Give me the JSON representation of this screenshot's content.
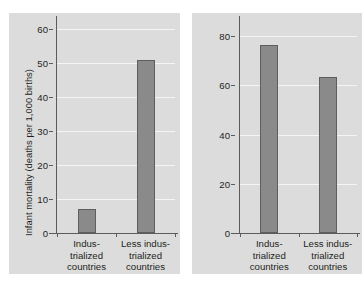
{
  "figure": {
    "background_color": "#ffffff",
    "panel_color": "#dcdcdc",
    "bar_color": "#8a8a8a",
    "bar_outline_color": "#5e5e5e",
    "gridline_color": "#f4f4f4",
    "axis_color": "#5b5b5b"
  },
  "chart_data": [
    {
      "type": "bar",
      "title": "",
      "xlabel": "",
      "ylabel": "Infant mortality (deaths per 1,000 births)",
      "categories": [
        "Indus-\ntrialized\ncountries",
        "Less indus-\ntrialized\ncountries"
      ],
      "category_lines": [
        [
          "Indus-",
          "trialized",
          "countries"
        ],
        [
          "Less indus-",
          "trialized",
          "countries"
        ]
      ],
      "values": [
        7,
        51
      ],
      "ylim": [
        0,
        63
      ],
      "yticks": [
        0,
        10,
        20,
        30,
        40,
        50,
        60
      ],
      "ytick_labels": [
        "0",
        "10",
        "20",
        "30",
        "40",
        "50",
        "60"
      ],
      "grid": true,
      "legend": "none"
    },
    {
      "type": "bar",
      "title": "",
      "xlabel": "",
      "ylabel": "Life expectancy (years)",
      "categories": [
        "Indus-\ntrialized\ncountries",
        "Less indus-\ntrialized\ncountries"
      ],
      "category_lines": [
        [
          "Indus-",
          "trialized",
          "countries"
        ],
        [
          "Less indus-",
          "trialized",
          "countries"
        ]
      ],
      "values": [
        76.5,
        63.5
      ],
      "ylim": [
        0,
        87
      ],
      "yticks": [
        0,
        20,
        40,
        60,
        80
      ],
      "ytick_labels": [
        "0",
        "20",
        "40",
        "60",
        "80"
      ],
      "grid": true,
      "legend": "none"
    }
  ]
}
